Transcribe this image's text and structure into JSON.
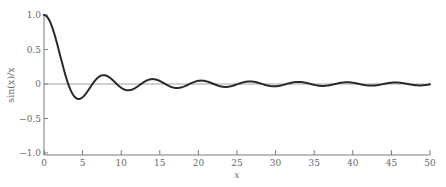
{
  "chart_data": {
    "type": "line",
    "title": "",
    "xlabel": "x",
    "ylabel": "sin(x)/x",
    "xlim": [
      0,
      50
    ],
    "ylim": [
      -1.0,
      1.0
    ],
    "grid": false,
    "legend": null,
    "x_ticks": [
      0,
      5,
      10,
      15,
      20,
      25,
      30,
      35,
      40,
      45,
      50
    ],
    "x_tick_labels": [
      "0",
      "5",
      "10",
      "15",
      "20",
      "25",
      "30",
      "35",
      "40",
      "45",
      "50"
    ],
    "y_ticks": [
      1.0,
      0.5,
      0,
      -0.5,
      -1.0
    ],
    "y_tick_labels": [
      "1.0",
      "0.5",
      "0",
      "−0.5",
      "−1.0"
    ],
    "zero_line": true,
    "series": [
      {
        "name": "sin(x)/x",
        "function": "sin(x)/x",
        "x": [
          0,
          1,
          2,
          3,
          3.14,
          4,
          4.49,
          5,
          6,
          6.28,
          7,
          7.73,
          8,
          9,
          9.42,
          10,
          10.9,
          12,
          12.57,
          14.07,
          15.71,
          17.22,
          18.85,
          20.37,
          21.99,
          23.52,
          25.13,
          26.67,
          28.27,
          29.81,
          31.42,
          32.95,
          34.56,
          36.1,
          37.7,
          39.24,
          40.84,
          42.39,
          43.98,
          45.53,
          47.12,
          48.67,
          50
        ],
        "values": [
          1.0,
          0.841,
          0.455,
          0.047,
          0.0,
          -0.189,
          -0.217,
          -0.192,
          -0.047,
          0.0,
          0.094,
          0.128,
          0.124,
          0.046,
          0.0,
          -0.054,
          -0.091,
          -0.045,
          0.0,
          0.071,
          0.0,
          -0.058,
          0.0,
          0.049,
          0.0,
          -0.042,
          0.0,
          0.037,
          0.0,
          -0.034,
          0.0,
          0.03,
          0.0,
          -0.028,
          0.0,
          0.025,
          0.0,
          -0.024,
          0.0,
          0.022,
          0.0,
          -0.021,
          -0.005
        ]
      }
    ],
    "colors": {
      "curve": "#2a2a2a",
      "axes": "#7a7a7a",
      "zero_line": "#8a8a8a",
      "text": "#6a6a6a"
    }
  }
}
